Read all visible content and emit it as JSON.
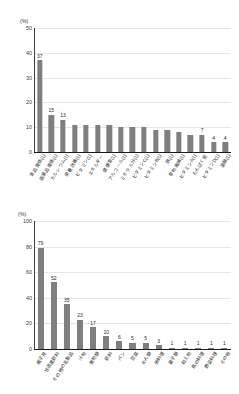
{
  "chart_data": [
    {
      "type": "bar",
      "title": "",
      "xlabel": "",
      "ylabel": "(%)",
      "ylim": [
        0,
        50
      ],
      "ytick_step": 10,
      "yticks": [
        0,
        10,
        20,
        30,
        40,
        50
      ],
      "grid": true,
      "legend": "none",
      "bar_color": "#7f7f7f",
      "categories": [
        "食品関係(1)",
        "医薬品関係(1)",
        "カルシウム(1)",
        "栄養改善(1)",
        "ビタミン(1)",
        "エネルギー",
        "健康食(1)",
        "アルコール(1)",
        "ミネラル分(1)",
        "ビタミンC(1)",
        "ビタミンB(1)",
        "鉄(1)",
        "食物繊維(1)",
        "ビタミンA(1)",
        "たんぱく質",
        "ビタミンD(1)",
        "葉酸(1)"
      ],
      "values": [
        37,
        15,
        13,
        11,
        11,
        11,
        11,
        10,
        10,
        10,
        9,
        9,
        8,
        7,
        7,
        4,
        4
      ],
      "value_labels": [
        "37",
        "15",
        "13",
        "",
        "",
        "",
        "",
        "",
        "",
        "",
        "",
        "",
        "",
        "",
        "7",
        "4",
        "4"
      ]
    },
    {
      "type": "bar",
      "title": "",
      "xlabel": "",
      "ylabel": "(%)",
      "ylim": [
        0,
        100
      ],
      "ytick_step": 20,
      "yticks": [
        0,
        20,
        40,
        60,
        80,
        100
      ],
      "grid": true,
      "legend": "none",
      "bar_color": "#7f7f7f",
      "categories": [
        "親子丼",
        "甘酒風飲料",
        "その他の乳製品",
        "汁物",
        "煮物類",
        "飲料",
        "パン",
        "豆腐",
        "めん類",
        "卵料理",
        "菓子類",
        "和え物",
        "魚の料理",
        "野菜料理",
        "その他"
      ],
      "values": [
        79,
        52,
        35,
        23,
        17,
        10,
        6,
        5,
        5,
        3,
        1,
        1,
        1,
        1,
        1
      ],
      "value_labels": [
        "79",
        "52",
        "35",
        "23",
        "17",
        "10",
        "6",
        "5",
        "5",
        "3",
        "1",
        "1",
        "1",
        "1",
        "1"
      ]
    }
  ]
}
